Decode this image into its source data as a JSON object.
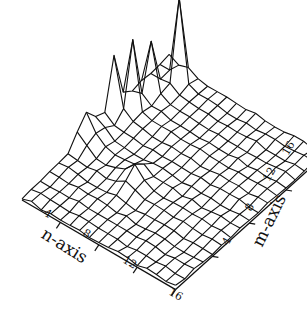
{
  "chart_data": {
    "type": "surface3d",
    "title": "",
    "xlabel": "n-axis",
    "ylabel": "m-axis",
    "zlabel": "",
    "x_ticks": [
      "4",
      "8",
      "12",
      "16"
    ],
    "y_ticks": [
      "4",
      "8",
      "12",
      "16"
    ],
    "x_range": [
      0,
      16
    ],
    "y_range": [
      0,
      16
    ],
    "grid": false,
    "legend": "none",
    "style": "black wireframe mesh on white, oblique view",
    "grid_size": [
      17,
      17
    ],
    "peaks": [
      {
        "n": 0,
        "m": 7,
        "z": 0.35
      },
      {
        "n": 0,
        "m": 10,
        "z": 0.75
      },
      {
        "n": 1,
        "m": 11,
        "z": 1.0
      },
      {
        "n": 1,
        "m": 13,
        "z": 0.7
      },
      {
        "n": 2,
        "m": 15,
        "z": 1.2
      },
      {
        "n": 6,
        "m": 6,
        "z": 0.25
      }
    ]
  },
  "labels": {
    "n_axis": "n-axis",
    "m_axis": "m-axis",
    "n_ticks": [
      "4",
      "8",
      "12",
      "16"
    ],
    "m_ticks": [
      "4",
      "8",
      "12",
      "16"
    ]
  }
}
